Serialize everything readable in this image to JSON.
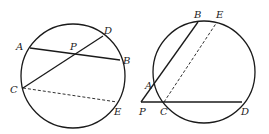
{
  "figures": [
    {
      "name": "left-figure",
      "circle": {
        "cx": 73,
        "cy": 76,
        "r": 52
      },
      "points": {
        "A": {
          "x": 30,
          "y": 48,
          "label": "A",
          "lx": 16,
          "ly": 50
        },
        "B": {
          "x": 120,
          "y": 60,
          "label": "B",
          "lx": 123,
          "ly": 64
        },
        "D": {
          "x": 103,
          "y": 36,
          "label": "D",
          "lx": 104,
          "ly": 34
        },
        "P": {
          "x": 76,
          "y": 54,
          "label": "P",
          "lx": 70,
          "ly": 50
        },
        "C": {
          "x": 23,
          "y": 88,
          "label": "C",
          "lx": 10,
          "ly": 93
        },
        "E": {
          "x": 117,
          "y": 102,
          "label": "E",
          "lx": 114,
          "ly": 115
        }
      },
      "segments": [
        {
          "from": "A",
          "to": "B",
          "style": "solid"
        },
        {
          "from": "C",
          "to": "D",
          "style": "solid"
        },
        {
          "from": "C",
          "to": "E",
          "style": "dashed"
        }
      ]
    },
    {
      "name": "right-figure",
      "circle": {
        "cx": 204,
        "cy": 72,
        "r": 51
      },
      "points": {
        "B": {
          "x": 198,
          "y": 22,
          "label": "B",
          "lx": 194,
          "ly": 18
        },
        "E": {
          "x": 217,
          "y": 22,
          "label": "E",
          "lx": 216,
          "ly": 18
        },
        "A": {
          "x": 155,
          "y": 87,
          "label": "A",
          "lx": 145,
          "ly": 89
        },
        "P": {
          "x": 141,
          "y": 102,
          "label": "P",
          "lx": 139,
          "ly": 115
        },
        "C": {
          "x": 164,
          "y": 102,
          "label": "C",
          "lx": 160,
          "ly": 115
        },
        "D": {
          "x": 242,
          "y": 102,
          "label": "D",
          "lx": 241,
          "ly": 115
        }
      },
      "segments": [
        {
          "from": "P",
          "to": "B",
          "style": "solid"
        },
        {
          "from": "P",
          "to": "D",
          "style": "solid"
        },
        {
          "from": "C",
          "to": "E",
          "style": "dashed"
        }
      ]
    }
  ]
}
